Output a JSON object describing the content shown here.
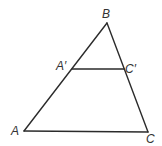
{
  "diagram": {
    "type": "triangle-with-midline",
    "stroke_color": "#2b2b2b",
    "label_color": "#333333",
    "background": "#ffffff",
    "points": {
      "A": {
        "x": 24,
        "y": 131
      },
      "B": {
        "x": 107,
        "y": 23
      },
      "C": {
        "x": 148,
        "y": 132
      },
      "A_prime": {
        "x": 72,
        "y": 69
      },
      "C_prime": {
        "x": 124,
        "y": 69
      }
    },
    "labels": {
      "A": "A",
      "B": "B",
      "C": "C",
      "A_prime": "A′",
      "C_prime": "C′"
    },
    "segments": [
      "AB",
      "BC",
      "AC",
      "A′C′"
    ]
  }
}
